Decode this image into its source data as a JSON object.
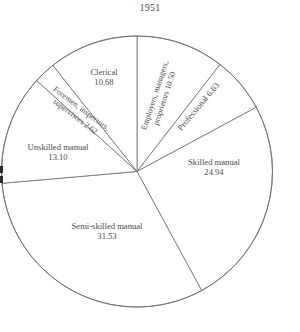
{
  "chart_data": {
    "type": "pie",
    "title": "1951",
    "xlabel": "",
    "ylabel": "",
    "units": "percent",
    "total": 100.0,
    "start_angle_deg": 0,
    "direction": "clockwise",
    "legend": "none",
    "grid": false,
    "categories": [
      "Employers, managers, proprietors",
      "Professional",
      "Skilled manual",
      "Semi-skilled manual",
      "Unskilled manual",
      "Foremen, inspectors, supervisors",
      "Clerical"
    ],
    "values": [
      10.5,
      6.63,
      24.94,
      31.53,
      13.1,
      2.62,
      10.68
    ],
    "slices": [
      {
        "name": "employers-managers-proprietors",
        "label_line1": "Employers, managers,",
        "label_line2": "proprietors 10.50",
        "value": 10.5,
        "value_text": "10.50",
        "start_deg": 0.0,
        "end_deg": 37.8,
        "label_rotation_deg": -72,
        "label_x": 160,
        "label_y": 97,
        "label_style": "rotated-two-line"
      },
      {
        "name": "professional",
        "label_line1": "Professional 6.63",
        "label_line2": "",
        "value": 6.63,
        "value_text": "6.63",
        "start_deg": 37.8,
        "end_deg": 61.7,
        "label_rotation_deg": -50,
        "label_x": 199,
        "label_y": 107,
        "label_style": "rotated-one-line"
      },
      {
        "name": "skilled-manual",
        "label_line1": "Skilled manual",
        "label_line2": "24.94",
        "value": 24.94,
        "value_text": "24.94",
        "start_deg": 61.7,
        "end_deg": 151.5,
        "label_rotation_deg": 0,
        "label_x": 214,
        "label_y": 168,
        "label_style": "horizontal-two-line"
      },
      {
        "name": "semi-skilled-manual",
        "label_line1": "Semi-skilled manual",
        "label_line2": "31.53",
        "value": 31.53,
        "value_text": "31.53",
        "start_deg": 151.5,
        "end_deg": 265.0,
        "label_rotation_deg": 0,
        "label_x": 107,
        "label_y": 232,
        "label_style": "horizontal-two-line"
      },
      {
        "name": "unskilled-manual",
        "label_line1": "Unskilled manual",
        "label_line2": "13.10",
        "value": 13.1,
        "value_text": "13.10",
        "start_deg": 265.0,
        "end_deg": 312.2,
        "label_rotation_deg": 0,
        "label_x": 58,
        "label_y": 153,
        "label_style": "horizontal-two-line"
      },
      {
        "name": "foremen-inspectors-supervisors",
        "label_line1": "Foremen, inspectors,",
        "label_line2": "supervisors 2.62",
        "value": 2.62,
        "value_text": "2.62",
        "start_deg": 312.2,
        "end_deg": 321.6,
        "label_rotation_deg": 37,
        "label_x": 78,
        "label_y": 113,
        "label_style": "rotated-two-line"
      },
      {
        "name": "clerical",
        "label_line1": "Clerical",
        "label_line2": "10.68",
        "value": 10.68,
        "value_text": "10.68",
        "start_deg": 321.6,
        "end_deg": 360.0,
        "label_rotation_deg": 0,
        "label_x": 104,
        "label_y": 78,
        "label_style": "horizontal-two-line"
      }
    ],
    "geometry": {
      "center_x": 137,
      "center_y": 171.5,
      "radius": 135.5
    },
    "colors": {
      "background": "#ffffff",
      "slice_fill": "#ffffff",
      "stroke": "#6e6e6e",
      "text": "#4a4a4a"
    }
  }
}
